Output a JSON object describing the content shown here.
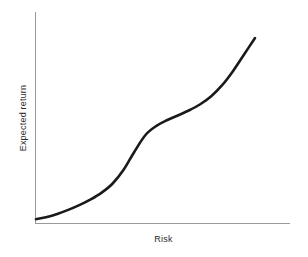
{
  "chart_data": {
    "type": "line",
    "title": "",
    "subtitle": "",
    "xlabel": "Risk",
    "ylabel": "Expected return",
    "grid": false,
    "legend": null,
    "legend_position": "none",
    "tick_labels_x": [],
    "tick_labels_y": [],
    "xlim": [
      0,
      1
    ],
    "ylim": [
      0,
      1
    ],
    "annotations": [],
    "series": [
      {
        "name": "Expected return vs risk",
        "color": "#1a1a1a",
        "line_width": 2.6,
        "x": [
          0.0,
          0.05,
          0.1,
          0.15,
          0.2,
          0.25,
          0.3,
          0.35,
          0.4,
          0.45,
          0.5,
          0.55,
          0.6,
          0.65,
          0.7,
          0.75,
          0.8,
          0.85,
          0.9,
          0.95,
          1.0
        ],
        "y": [
          0.01,
          0.022,
          0.04,
          0.062,
          0.088,
          0.118,
          0.155,
          0.205,
          0.28,
          0.38,
          0.47,
          0.52,
          0.552,
          0.578,
          0.605,
          0.638,
          0.682,
          0.742,
          0.82,
          0.91,
          1.0
        ]
      }
    ]
  },
  "axes": {
    "line_color": "#9a9a9a",
    "line_width": 1,
    "x_axis": {
      "x_start": 35,
      "x_end": 290,
      "y": 223
    },
    "y_axis": {
      "x": 35,
      "y_start": 12,
      "y_end": 223
    }
  },
  "canvas": {
    "background": "#ffffff",
    "width": 308,
    "height": 257
  }
}
